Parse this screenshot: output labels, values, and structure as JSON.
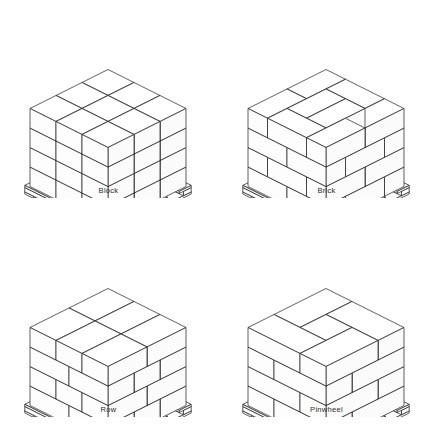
{
  "figure": {
    "background_color": "#ffffff",
    "line_color": "#1a1a1a",
    "label_color": "#2b2b2b",
    "columns": 2,
    "rows": 2
  },
  "patterns": [
    {
      "id": "block",
      "label": "Block",
      "description": "All cartons aligned in identical orientation on every layer; no interlocking.",
      "grid": {
        "along_x": 3,
        "along_y": 3
      },
      "layers": 4,
      "top_layout": [
        {
          "x": 0,
          "y": 0,
          "w": 1,
          "h": 1
        },
        {
          "x": 1,
          "y": 0,
          "w": 1,
          "h": 1
        },
        {
          "x": 2,
          "y": 0,
          "w": 1,
          "h": 1
        },
        {
          "x": 0,
          "y": 1,
          "w": 1,
          "h": 1
        },
        {
          "x": 1,
          "y": 1,
          "w": 1,
          "h": 1
        },
        {
          "x": 2,
          "y": 1,
          "w": 1,
          "h": 1
        },
        {
          "x": 0,
          "y": 2,
          "w": 1,
          "h": 1
        },
        {
          "x": 1,
          "y": 2,
          "w": 1,
          "h": 1
        },
        {
          "x": 2,
          "y": 2,
          "w": 1,
          "h": 1
        }
      ],
      "course_offsets": [
        0,
        0,
        0,
        0
      ]
    },
    {
      "id": "brick",
      "label": "Brick",
      "description": "Cartons laid like brickwork; alternate layers rotated so joints are staggered.",
      "grid": {
        "along_x": 3,
        "along_y": 3
      },
      "layers": 4,
      "top_layout": [
        {
          "x": 0,
          "y": 0,
          "w": 1.5,
          "h": 0.75
        },
        {
          "x": 1.5,
          "y": 0,
          "w": 1.5,
          "h": 0.75
        },
        {
          "x": 0,
          "y": 0.75,
          "w": 0.75,
          "h": 1.5
        },
        {
          "x": 0.75,
          "y": 0.75,
          "w": 1.5,
          "h": 0.75
        },
        {
          "x": 2.25,
          "y": 0.75,
          "w": 0.75,
          "h": 1.5
        },
        {
          "x": 0.75,
          "y": 1.5,
          "w": 1.5,
          "h": 0.75
        },
        {
          "x": 0,
          "y": 2.25,
          "w": 1.5,
          "h": 0.75
        },
        {
          "x": 1.5,
          "y": 2.25,
          "w": 1.5,
          "h": 0.75
        }
      ],
      "course_offsets": [
        0,
        0.5,
        0,
        0.5
      ]
    },
    {
      "id": "row",
      "label": "Row",
      "description": "Cartons placed in straight rows with each successive layer shifted half a carton.",
      "grid": {
        "along_x": 3,
        "along_y": 3
      },
      "layers": 4,
      "top_layout": [
        {
          "x": 0,
          "y": 0,
          "w": 1,
          "h": 1
        },
        {
          "x": 1,
          "y": 0,
          "w": 1,
          "h": 1
        },
        {
          "x": 2,
          "y": 0,
          "w": 1,
          "h": 1
        },
        {
          "x": 0,
          "y": 1,
          "w": 1,
          "h": 1
        },
        {
          "x": 1,
          "y": 1,
          "w": 1,
          "h": 1
        },
        {
          "x": 2,
          "y": 1,
          "w": 1,
          "h": 1
        },
        {
          "x": 0,
          "y": 2,
          "w": 1,
          "h": 1
        },
        {
          "x": 1,
          "y": 2,
          "w": 1,
          "h": 1
        },
        {
          "x": 2,
          "y": 2,
          "w": 1,
          "h": 1
        }
      ],
      "course_offsets": [
        0,
        0.5,
        0,
        0.5
      ]
    },
    {
      "id": "pinwheel",
      "label": "Pinwheel",
      "description": "Cartons arranged rotationally about the pallet centre leaving a central void.",
      "grid": {
        "along_x": 3,
        "along_y": 3
      },
      "layers": 4,
      "top_layout": [
        {
          "x": 0,
          "y": 0,
          "w": 2,
          "h": 1
        },
        {
          "x": 2,
          "y": 0,
          "w": 1,
          "h": 2
        },
        {
          "x": 0,
          "y": 1,
          "w": 1,
          "h": 2
        },
        {
          "x": 1,
          "y": 1,
          "w": 1,
          "h": 1
        },
        {
          "x": 1,
          "y": 2,
          "w": 2,
          "h": 1
        }
      ],
      "course_offsets": [
        0,
        0.34,
        0.66,
        0.34
      ]
    }
  ],
  "pallet": {
    "name": "wooden-stringer-pallet",
    "deck_boards": 4,
    "stringers": 3
  }
}
